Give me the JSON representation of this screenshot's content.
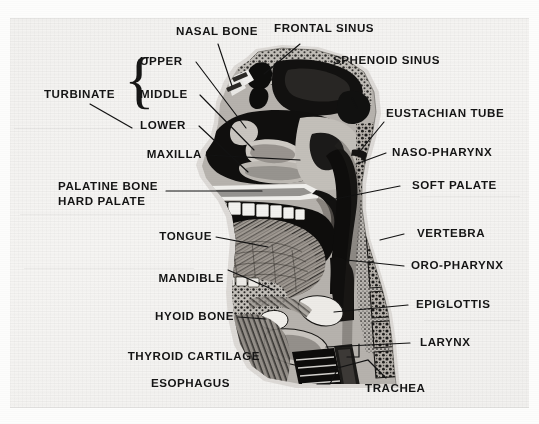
{
  "figure": {
    "medium": "halftone print scan",
    "background_color": "#f4f3f1",
    "ink_color": "#141414"
  },
  "labels": {
    "nasal_bone": "NASAL BONE",
    "frontal_sinus": "FRONTAL SINUS",
    "sphenoid_sinus": "SPHENOID SINUS",
    "eustachian_tube": "EUSTACHIAN TUBE",
    "naso_pharynx": "NASO-PHARYNX",
    "soft_palate": "SOFT PALATE",
    "vertebra": "VERTEBRA",
    "oro_pharynx": "ORO-PHARYNX",
    "epiglottis": "EPIGLOTTIS",
    "larynx": "LARYNX",
    "trachea": "TRACHEA",
    "esophagus": "ESOPHAGUS",
    "thyroid_cartilage": "THYROID CARTILAGE",
    "hyoid_bone": "HYOID BONE",
    "mandible": "MANDIBLE",
    "tongue": "TONGUE",
    "palatine_bone": "PALATINE BONE",
    "hard_palate": "HARD PALATE",
    "maxilla": "MAXILLA",
    "turbinate": "TURBINATE",
    "turbinate_upper": "UPPER",
    "turbinate_middle": "MIDDLE",
    "turbinate_lower": "LOWER",
    "turbinate_brace": "{"
  }
}
